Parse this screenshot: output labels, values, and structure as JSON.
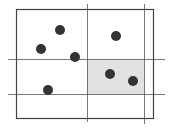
{
  "diagram": {
    "type": "scatter-partition",
    "colors": {
      "line": "#555555",
      "frame": "#444444",
      "shade": "#e2e2e2",
      "dot": "#333333",
      "background": "#ffffff"
    },
    "frame": {
      "x": 16,
      "y": 9,
      "w": 137,
      "h": 109
    },
    "vertical_lines": [
      {
        "x": 87,
        "y1": 4,
        "y2": 122
      },
      {
        "x": 144,
        "y1": 4,
        "y2": 124
      }
    ],
    "horizontal_lines": [
      {
        "y": 59,
        "x1": 8,
        "x2": 165
      },
      {
        "y": 94,
        "x1": 8,
        "x2": 165
      }
    ],
    "shaded_region": {
      "x": 87,
      "y": 59,
      "w": 57,
      "h": 35
    },
    "points": [
      {
        "x": 60,
        "y": 30
      },
      {
        "x": 41,
        "y": 49
      },
      {
        "x": 75,
        "y": 57
      },
      {
        "x": 116,
        "y": 36
      },
      {
        "x": 48,
        "y": 90
      },
      {
        "x": 110,
        "y": 74
      },
      {
        "x": 133,
        "y": 81
      }
    ],
    "point_radius": 5
  }
}
